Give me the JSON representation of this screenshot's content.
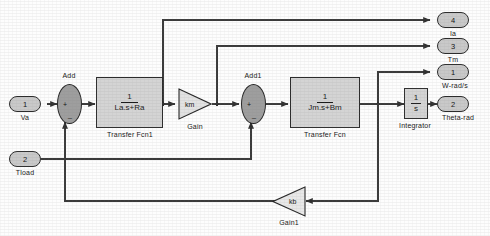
{
  "diagram": {
    "background_color": "#fdfdfd",
    "block_fill": "#d4d4d4",
    "sum_fill": "#9e9e9e",
    "port_fill": "#c9c9c9",
    "line_color": "#3a3a3a"
  },
  "inputs": [
    {
      "number": "1",
      "label": "Va"
    },
    {
      "number": "2",
      "label": "Tload"
    }
  ],
  "outputs": [
    {
      "number": "4",
      "label": "Ia"
    },
    {
      "number": "3",
      "label": "Tm"
    },
    {
      "number": "1",
      "label": "W-rad/s"
    },
    {
      "number": "2",
      "label": "Theta-rad"
    }
  ],
  "sums": [
    {
      "name": "Add",
      "label": "Add",
      "sign_left": "+",
      "sign_bottom": "_"
    },
    {
      "name": "Add1",
      "label": "Add1",
      "sign_left": "+",
      "sign_bottom": "_"
    }
  ],
  "transfer_functions": [
    {
      "name": "Transfer Fcn1",
      "caption": "Transfer Fcn1",
      "numerator": "1",
      "denominator": "La.s+Ra"
    },
    {
      "name": "Transfer Fcn",
      "caption": "Transfer Fcn",
      "numerator": "1",
      "denominator": "Jm.s+Bm"
    }
  ],
  "gains": [
    {
      "name": "Gain",
      "symbol": "km",
      "caption": "Gain",
      "direction": "right"
    },
    {
      "name": "Gain1",
      "symbol": "kb",
      "caption": "Gain1",
      "direction": "left"
    }
  ],
  "integrator": {
    "caption": "Integrator",
    "numerator": "1",
    "denominator": "s"
  },
  "annotations": [
    {
      "text": "W-rad/s"
    }
  ]
}
